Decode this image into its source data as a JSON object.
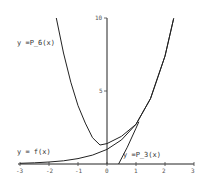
{
  "chart_data": {
    "type": "line",
    "title": "",
    "xlabel": "",
    "ylabel": "",
    "xlim": [
      -3,
      3
    ],
    "ylim": [
      0,
      10
    ],
    "grid": false,
    "x_ticks": [
      "-3",
      "-2",
      "-1",
      "0",
      "1",
      "2",
      "3"
    ],
    "y_ticks": [
      "5",
      "10"
    ],
    "series": [
      {
        "name": "y = f(x)",
        "x": [
          -3,
          -2.5,
          -2,
          -1.5,
          -1,
          -0.5,
          0,
          0.5,
          1,
          1.5,
          2,
          2.3
        ],
        "values": [
          0.05,
          0.08,
          0.14,
          0.22,
          0.37,
          0.61,
          1.0,
          1.65,
          2.72,
          4.48,
          7.39,
          9.97
        ]
      },
      {
        "name": "y = P_6(x)",
        "x": [
          -1.75,
          -1.5,
          -1.25,
          -1,
          -0.75,
          -0.5,
          -0.24,
          0,
          0.5,
          1,
          1.5,
          2,
          2.3
        ],
        "values": [
          10,
          7.6,
          5.6,
          4.0,
          2.8,
          1.8,
          1.3,
          1.4,
          1.9,
          2.72,
          4.48,
          7.39,
          9.97
        ]
      },
      {
        "name": "y = P_3(x)",
        "x": [
          0.4,
          0.7,
          1.0,
          1.1
        ],
        "values": [
          0,
          1.15,
          2.45,
          2.9
        ]
      }
    ],
    "annotations": [
      {
        "text": "y =P_6(x)",
        "x": -3.1,
        "y": 8.5
      },
      {
        "text": "y = f(x)",
        "x": -3.1,
        "y": 1.0
      },
      {
        "text": "y =P_3(x)",
        "x": 0.5,
        "y": 0.4
      }
    ]
  },
  "labels": {
    "p6": "y =P_6(x)",
    "f": "y = f(x)",
    "p3": "y =P_3(x)"
  },
  "ticks": {
    "x": [
      "-3",
      "-2",
      "-1",
      "0",
      "1",
      "2",
      "3"
    ],
    "y5": "5",
    "y10": "10"
  }
}
